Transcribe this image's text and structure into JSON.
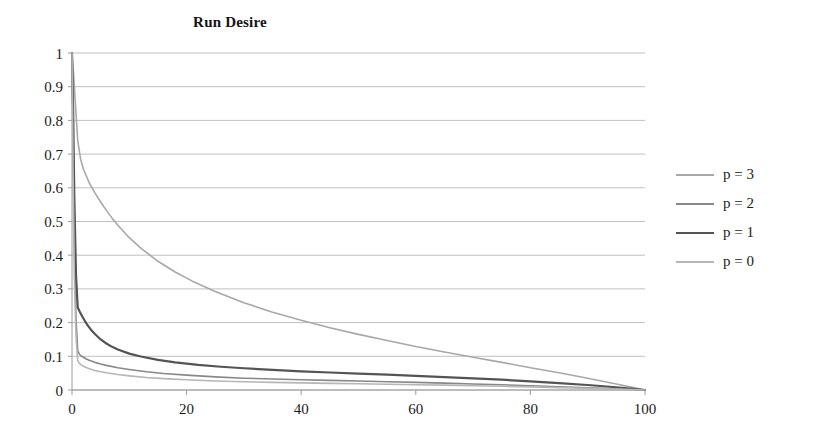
{
  "chart_data": {
    "type": "line",
    "title": "Run Desire",
    "xlabel": "",
    "ylabel": "",
    "xlim": [
      0,
      100
    ],
    "ylim": [
      0,
      1
    ],
    "grid": true,
    "grid_axis": "y",
    "legend_position": "right",
    "x_ticks": [
      0,
      20,
      40,
      60,
      80,
      100
    ],
    "y_ticks": [
      0,
      0.1,
      0.2,
      0.3,
      0.4,
      0.5,
      0.6,
      0.7,
      0.8,
      0.9,
      1
    ],
    "x_tick_labels": [
      "0",
      "20",
      "40",
      "60",
      "80",
      "100"
    ],
    "y_tick_labels": [
      "0",
      "0.1",
      "0.2",
      "0.3",
      "0.4",
      "0.5",
      "0.6",
      "0.7",
      "0.8",
      "0.9",
      "1"
    ],
    "series": [
      {
        "name": "p = 3",
        "color": "#a8a8a8",
        "width": 1.6,
        "x": [
          0,
          0.3,
          0.7,
          1,
          1.5,
          2,
          3,
          4,
          5,
          6,
          7,
          8,
          10,
          12,
          15,
          18,
          21,
          25,
          30,
          35,
          40,
          45,
          50,
          55,
          60,
          65,
          70,
          75,
          80,
          85,
          90,
          95,
          98,
          100
        ],
        "y": [
          1,
          0.93,
          0.82,
          0.74,
          0.685,
          0.655,
          0.615,
          0.585,
          0.558,
          0.533,
          0.51,
          0.489,
          0.452,
          0.421,
          0.382,
          0.35,
          0.323,
          0.292,
          0.259,
          0.231,
          0.207,
          0.185,
          0.165,
          0.147,
          0.129,
          0.113,
          0.097,
          0.082,
          0.066,
          0.051,
          0.035,
          0.018,
          0.007,
          0
        ]
      },
      {
        "name": "p = 2",
        "color": "#888888",
        "width": 1.6,
        "x": [
          0,
          0.2,
          0.4,
          0.7,
          1,
          1.3,
          1.6,
          2,
          2.5,
          3,
          4,
          5,
          6,
          8,
          10,
          13,
          16,
          20,
          25,
          30,
          35,
          40,
          45,
          50,
          55,
          60,
          65,
          70,
          75,
          80,
          85,
          90,
          95,
          98,
          100
        ],
        "y": [
          1,
          0.72,
          0.43,
          0.21,
          0.117,
          0.106,
          0.101,
          0.097,
          0.092,
          0.088,
          0.082,
          0.077,
          0.073,
          0.066,
          0.061,
          0.054,
          0.049,
          0.044,
          0.039,
          0.035,
          0.0325,
          0.0305,
          0.0285,
          0.0265,
          0.0245,
          0.0225,
          0.0205,
          0.018,
          0.0155,
          0.0128,
          0.0098,
          0.0068,
          0.0034,
          0.0014,
          0
        ]
      },
      {
        "name": "p = 1",
        "color": "#545454",
        "width": 2.2,
        "x": [
          0,
          0.2,
          0.4,
          0.7,
          1,
          1.4,
          1.8,
          2.2,
          2.6,
          3,
          3.5,
          4,
          5,
          6,
          7,
          8,
          10,
          12,
          15,
          18,
          22,
          26,
          30,
          35,
          40,
          45,
          50,
          55,
          60,
          65,
          70,
          75,
          80,
          85,
          90,
          95,
          98,
          100
        ],
        "y": [
          1,
          0.83,
          0.58,
          0.34,
          0.245,
          0.231,
          0.218,
          0.206,
          0.195,
          0.186,
          0.175,
          0.166,
          0.15,
          0.138,
          0.128,
          0.12,
          0.108,
          0.0995,
          0.0895,
          0.082,
          0.0745,
          0.069,
          0.0645,
          0.0595,
          0.0555,
          0.052,
          0.0485,
          0.0455,
          0.042,
          0.0385,
          0.0345,
          0.0305,
          0.0258,
          0.0205,
          0.0148,
          0.0082,
          0.0035,
          0
        ]
      },
      {
        "name": "p = 0",
        "color": "#b6b6b6",
        "width": 1.6,
        "x": [
          0,
          0.2,
          0.4,
          0.7,
          1,
          1.3,
          1.6,
          2,
          2.5,
          3,
          4,
          5,
          6,
          8,
          10,
          13,
          16,
          20,
          25,
          30,
          35,
          40,
          45,
          50,
          55,
          60,
          65,
          70,
          75,
          80,
          85,
          90,
          95,
          98,
          100
        ],
        "y": [
          1,
          0.63,
          0.34,
          0.16,
          0.087,
          0.079,
          0.0745,
          0.0705,
          0.0665,
          0.0632,
          0.058,
          0.0542,
          0.051,
          0.0458,
          0.042,
          0.0372,
          0.0338,
          0.0302,
          0.0268,
          0.0243,
          0.0225,
          0.0211,
          0.0198,
          0.0185,
          0.0172,
          0.0158,
          0.0144,
          0.0128,
          0.0111,
          0.0092,
          0.0071,
          0.005,
          0.0025,
          0.001,
          0
        ]
      }
    ]
  },
  "legend": {
    "items": [
      {
        "label": "p = 3",
        "color": "#a8a8a8"
      },
      {
        "label": "p = 2",
        "color": "#888888"
      },
      {
        "label": "p = 1",
        "color": "#545454"
      },
      {
        "label": "p = 0",
        "color": "#b6b6b6"
      }
    ]
  }
}
